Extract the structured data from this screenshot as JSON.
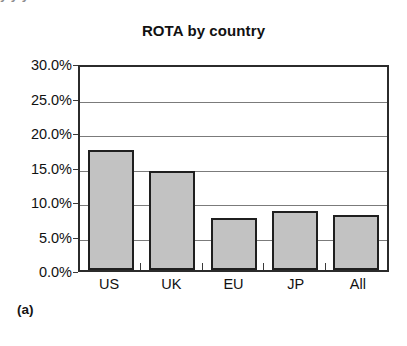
{
  "figure": {
    "caption_label": "(a)",
    "cutoff_text_fragment": "y        y      y"
  },
  "chart_data": {
    "type": "bar",
    "title": "ROTA by country",
    "xlabel": "",
    "ylabel": "",
    "categories": [
      "US",
      "UK",
      "EU",
      "JP",
      "All"
    ],
    "values": [
      17.4,
      14.3,
      7.5,
      8.5,
      8.0
    ],
    "value_labels": [
      "17.4%",
      "14.3%",
      "7.5%",
      "8.5%",
      "8.0%"
    ],
    "ylim": [
      0,
      30
    ],
    "ytick_values": [
      0,
      5,
      10,
      15,
      20,
      25,
      30
    ],
    "ytick_labels": [
      "0.0%",
      "5.0%",
      "10.0%",
      "15.0%",
      "20.0%",
      "25.0%",
      "30.0%"
    ],
    "grid": true,
    "legend": null,
    "colors": {
      "bar_fill": "#c2c2c2",
      "bar_border": "#1f1f1f",
      "gridline": "#7b7b7b",
      "frame": "#2b2b2b",
      "text": "#111111",
      "background": "#ffffff"
    }
  }
}
